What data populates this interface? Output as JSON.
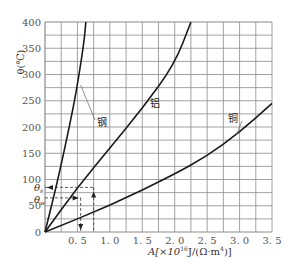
{
  "chart_data": {
    "type": "line",
    "title": "",
    "xlabel": "A[×10¹⁶J/(Ω·m⁴)]",
    "ylabel": "θ(℃)",
    "xlim": [
      0,
      3.5
    ],
    "ylim": [
      0,
      400
    ],
    "grid": true,
    "x_ticks": [
      "0.5",
      "1.0",
      "1.5",
      "2.0",
      "2.5",
      "3.0",
      "3.5"
    ],
    "y_ticks": [
      "0",
      "50",
      "100",
      "150",
      "200",
      "250",
      "300",
      "350",
      "400"
    ],
    "series": [
      {
        "name": "钢",
        "x": [
          0,
          0.2,
          0.4,
          0.5,
          0.6,
          0.63
        ],
        "y": [
          0,
          100,
          215,
          280,
          360,
          400
        ]
      },
      {
        "name": "铝",
        "x": [
          0,
          0.5,
          1.0,
          1.5,
          2.0,
          2.25
        ],
        "y": [
          0,
          85,
          160,
          235,
          320,
          400
        ]
      },
      {
        "name": "铜",
        "x": [
          0,
          1.0,
          2.0,
          2.5,
          3.0,
          3.5
        ],
        "y": [
          0,
          50,
          110,
          145,
          190,
          245
        ]
      }
    ],
    "annotations": [
      {
        "label": "θs",
        "y": 85,
        "x": 0.75
      },
      {
        "label": "θw",
        "y": 65,
        "x": 0.55
      }
    ]
  },
  "labels": {
    "steel": "钢",
    "aluminum": "铝",
    "copper": "铜",
    "theta_s": "θ",
    "theta_s_sub": "s",
    "theta_w": "θ",
    "theta_w_sub": "w",
    "ylabel_theta": "θ(℃)",
    "xlabel_prefix": "A[×10",
    "xlabel_exp": "16",
    "xlabel_mid": "J/(Ω·m",
    "xlabel_exp2": "4",
    "xlabel_suffix": ")]"
  }
}
